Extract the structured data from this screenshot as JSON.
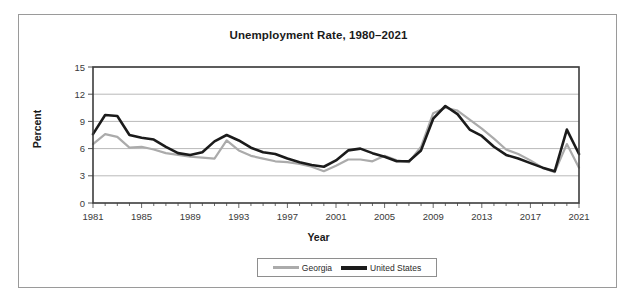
{
  "chart_data": {
    "type": "line",
    "title": "Unemployment Rate, 1980–2021",
    "xlabel": "Year",
    "ylabel": "Percent",
    "xlim": [
      1981,
      2021
    ],
    "ylim": [
      0,
      15
    ],
    "ytick_labels": [
      "0",
      "3",
      "6",
      "9",
      "12",
      "15"
    ],
    "yticks": [
      0,
      3,
      6,
      9,
      12,
      15
    ],
    "xtick_labels": [
      "1981",
      "1985",
      "1989",
      "1993",
      "1997",
      "2001",
      "2005",
      "2009",
      "2013",
      "2017",
      "2021"
    ],
    "xticks": [
      1981,
      1985,
      1989,
      1993,
      1997,
      2001,
      2005,
      2009,
      2013,
      2017,
      2021
    ],
    "minor_xtick_interval": 1,
    "grid": "horizontal",
    "legend_position": "bottom-center",
    "x": [
      1981,
      1982,
      1983,
      1984,
      1985,
      1986,
      1987,
      1988,
      1989,
      1990,
      1991,
      1992,
      1993,
      1994,
      1995,
      1996,
      1997,
      1998,
      1999,
      2000,
      2001,
      2002,
      2003,
      2004,
      2005,
      2006,
      2007,
      2008,
      2009,
      2010,
      2011,
      2012,
      2013,
      2014,
      2015,
      2016,
      2017,
      2018,
      2019,
      2020,
      2021
    ],
    "series": [
      {
        "name": "Georgia",
        "color": "#ababab",
        "values": [
          6.5,
          7.6,
          7.3,
          6.1,
          6.2,
          5.9,
          5.5,
          5.3,
          5.1,
          5.0,
          4.9,
          6.9,
          5.8,
          5.2,
          4.9,
          4.6,
          4.5,
          4.3,
          4.0,
          3.5,
          4.1,
          4.8,
          4.8,
          4.6,
          5.2,
          4.7,
          4.5,
          6.2,
          9.9,
          10.5,
          10.2,
          9.2,
          8.2,
          7.1,
          5.9,
          5.4,
          4.7,
          3.9,
          3.4,
          6.5,
          3.9
        ]
      },
      {
        "name": "United States",
        "color": "#1b1b1b",
        "values": [
          7.6,
          9.7,
          9.6,
          7.5,
          7.2,
          7.0,
          6.2,
          5.5,
          5.3,
          5.6,
          6.8,
          7.5,
          6.9,
          6.1,
          5.6,
          5.4,
          4.9,
          4.5,
          4.2,
          4.0,
          4.7,
          5.8,
          6.0,
          5.5,
          5.1,
          4.6,
          4.6,
          5.8,
          9.3,
          10.7,
          9.8,
          8.1,
          7.4,
          6.2,
          5.3,
          4.9,
          4.4,
          3.9,
          3.5,
          8.1,
          5.4
        ]
      }
    ]
  },
  "legend": {
    "items": [
      {
        "label": "Georgia"
      },
      {
        "label": "United States"
      }
    ]
  }
}
